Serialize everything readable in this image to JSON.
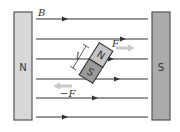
{
  "diagram": {
    "field_label": "B",
    "left_magnet": {
      "pole": "N",
      "fill": "#d6d6d6",
      "stroke": "#555555"
    },
    "right_magnet": {
      "pole": "S",
      "fill": "#a9a9a9",
      "stroke": "#555555"
    },
    "compass_needle": {
      "north": "N",
      "south": "S",
      "length_label": "l"
    },
    "forces": {
      "on_north": "F",
      "on_south": "−F",
      "arrow_color": "#c8c8c8"
    },
    "field_line_color": "#333333",
    "field_line_count": 6
  }
}
